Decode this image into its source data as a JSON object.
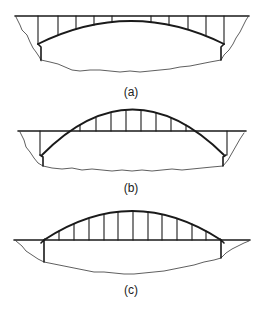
{
  "figure": {
    "panels": [
      {
        "id": "a",
        "label": "(a)",
        "type": "deck-arch"
      },
      {
        "id": "b",
        "label": "(b)",
        "type": "half-through-arch"
      },
      {
        "id": "c",
        "label": "(c)",
        "type": "through-arch"
      }
    ],
    "colors": {
      "line": "#1a1a1a",
      "background": "#ffffff"
    }
  }
}
